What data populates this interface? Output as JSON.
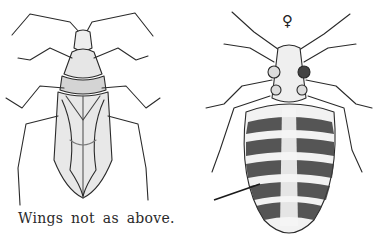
{
  "figure": {
    "left": {
      "subject": "winged-true-bug-dorsal-view",
      "caption": "Wings not as above."
    },
    "right": {
      "subject": "bed-bug-female-ventral-view",
      "sex_symbol": "♀",
      "has_pointer_arrow": true
    },
    "colors": {
      "ink": "#2a2a2a",
      "paper": "#ffffff",
      "shade": "#9a9a9a"
    }
  }
}
